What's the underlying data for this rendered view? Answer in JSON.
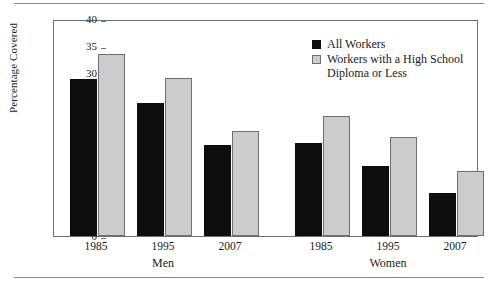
{
  "chart_data": {
    "type": "bar",
    "title": "",
    "subtitle": "",
    "xlabel": "",
    "ylabel": "Percentage Covered",
    "ylim": [
      0,
      40
    ],
    "yticks": [
      0,
      5,
      10,
      15,
      20,
      25,
      30,
      35,
      40
    ],
    "ytick_labels": [
      "0",
      "5",
      "10",
      "15",
      "20",
      "25",
      "30",
      "35",
      "40"
    ],
    "grid": false,
    "legend_position": "top-right",
    "categories": [
      "1985",
      "1995",
      "2007",
      "1985",
      "1995",
      "2007"
    ],
    "groups": [
      {
        "label": "Men",
        "categories": [
          "1985",
          "1995",
          "2007"
        ]
      },
      {
        "label": "Women",
        "categories": [
          "1985",
          "1995",
          "2007"
        ]
      }
    ],
    "series": [
      {
        "name": "All Workers",
        "color": "#0d0d0d",
        "values": [
          29.0,
          24.5,
          16.7,
          17.2,
          12.9,
          8.0
        ]
      },
      {
        "name": "Workers with a High School\nDiploma or Less",
        "color": "#cccccc",
        "values": [
          33.5,
          29.1,
          19.3,
          22.2,
          18.3,
          12.0
        ]
      }
    ],
    "annotations": []
  },
  "legend": {
    "items": [
      {
        "label": "All Workers",
        "swatch": "black-square"
      },
      {
        "label": "Workers with a High School\nDiploma or Less",
        "swatch": "gray-square"
      }
    ]
  },
  "axes": {
    "y_label": "Percentage Covered",
    "y_ticks": [
      "40",
      "35",
      "30",
      "25",
      "20",
      "15",
      "10",
      "5",
      "0"
    ],
    "x_group_labels": [
      "Men",
      "Women"
    ],
    "x_tick_labels_men": [
      "1985",
      "1995",
      "2007"
    ],
    "x_tick_labels_women": [
      "1985",
      "1995",
      "2007"
    ]
  },
  "colors": {
    "all_workers": "#0d0d0d",
    "hs_or_less": "#cccccc",
    "frame": "#6f6f6f",
    "rule": "#8a8a8a",
    "background": "#ffffff"
  }
}
